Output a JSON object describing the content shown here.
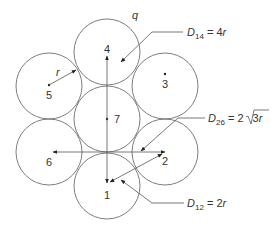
{
  "figure": {
    "conductors": [
      {
        "id": "1",
        "label": "1",
        "cx": 107,
        "cy": 186
      },
      {
        "id": "2",
        "label": "2",
        "cx": 165,
        "cy": 152
      },
      {
        "id": "3",
        "label": "3",
        "cx": 165,
        "cy": 86
      },
      {
        "id": "4",
        "label": "4",
        "cx": 107,
        "cy": 52
      },
      {
        "id": "5",
        "label": "5",
        "cx": 49,
        "cy": 86
      },
      {
        "id": "6",
        "label": "6",
        "cx": 49,
        "cy": 152
      },
      {
        "id": "7",
        "label": "7",
        "cx": 107,
        "cy": 119
      }
    ],
    "radius_px": 33,
    "labels": {
      "radius": "r",
      "q": "q",
      "d14": {
        "symbol": "D",
        "sub": "14",
        "eq": " = 4",
        "var": "r"
      },
      "d26": {
        "symbol": "D",
        "sub": "26",
        "eq": " = 2",
        "sqrt": "3",
        "var": "r"
      },
      "d12": {
        "symbol": "D",
        "sub": "12",
        "eq": " = 2",
        "var": "r"
      }
    },
    "colors": {
      "stroke": "#6e6e6e",
      "text": "#333333",
      "background": "#ffffff"
    }
  }
}
